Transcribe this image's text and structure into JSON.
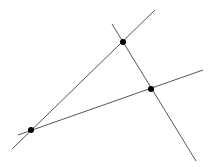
{
  "diagram": {
    "points": [
      {
        "id": "A",
        "label": "",
        "x": 31,
        "y": 130
      },
      {
        "id": "B",
        "label": "",
        "x": 123,
        "y": 42
      },
      {
        "id": "C",
        "label": "",
        "x": 151,
        "y": 89
      }
    ],
    "lines": [
      {
        "id": "line-AB",
        "through": [
          "A",
          "B"
        ],
        "from": [
          12,
          149
        ],
        "to": [
          155,
          10
        ]
      },
      {
        "id": "line-AC",
        "through": [
          "A",
          "C"
        ],
        "from": [
          18,
          135
        ],
        "to": [
          203,
          70
        ]
      },
      {
        "id": "line-BC",
        "through": [
          "B",
          "C"
        ],
        "from": [
          112,
          24
        ],
        "to": [
          196,
          161
        ]
      }
    ],
    "colors": {
      "line": "#555555",
      "point": "#000000",
      "background": "#ffffff"
    }
  }
}
